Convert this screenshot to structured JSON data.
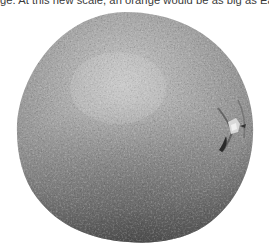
{
  "caption": {
    "text": "ge. At this new scale, an orange would be as big as Earth."
  },
  "image": {
    "subject": "orange",
    "description": "Grayscale photograph of a whole orange with dimpled peel, stem end on the right side",
    "tone": "grayscale",
    "colors": {
      "highlight": "#c2c2c2",
      "midtone": "#9a9a9a",
      "shadow": "#4a4a4a",
      "background": "#ffffff"
    }
  }
}
